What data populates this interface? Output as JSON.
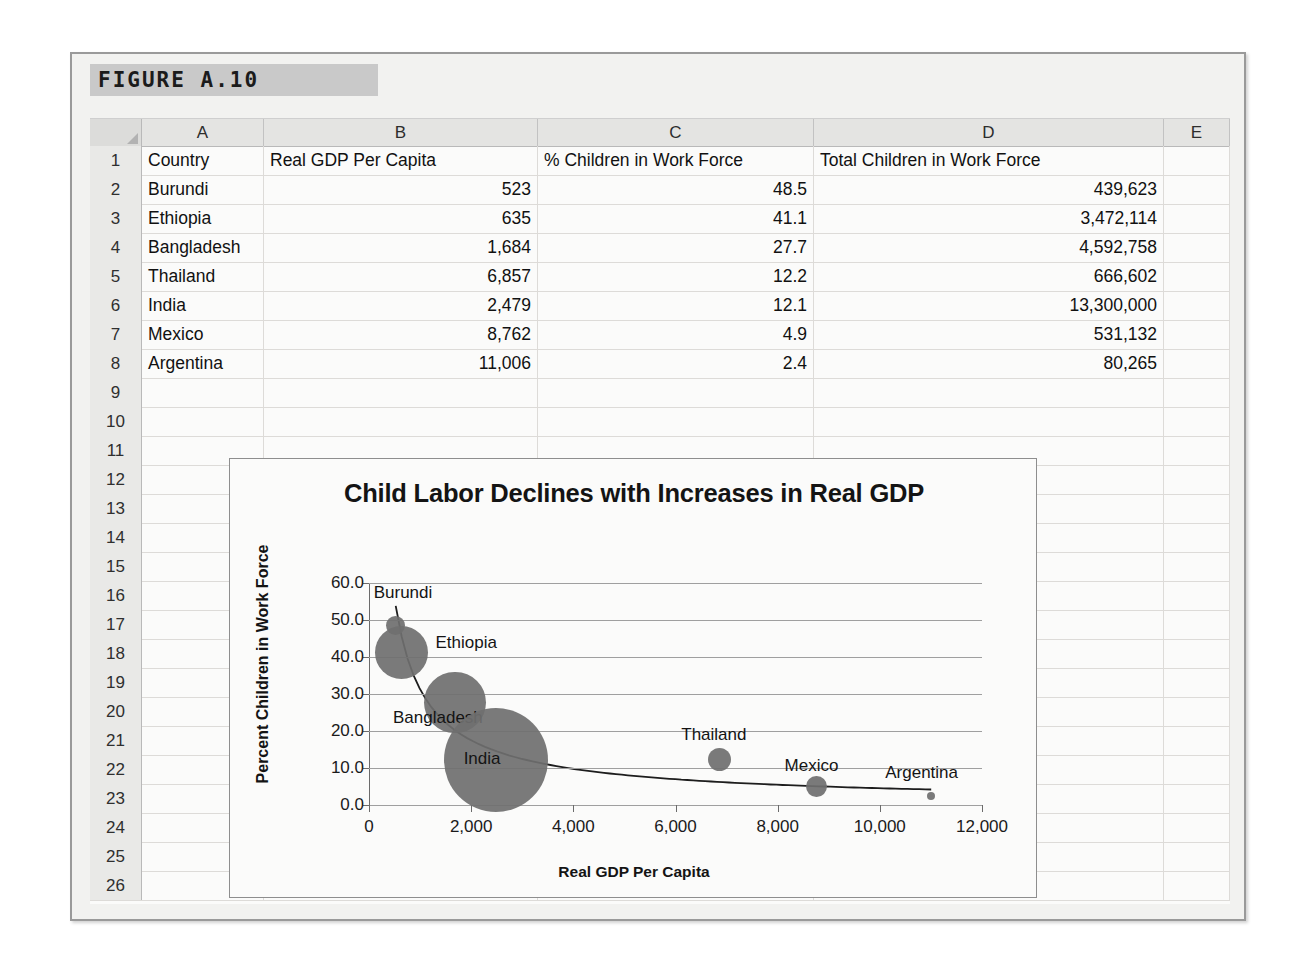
{
  "figure": {
    "banner_label": "FIGURE A.10"
  },
  "spreadsheet": {
    "column_headers": [
      "A",
      "B",
      "C",
      "D",
      "E"
    ],
    "row_numbers": [
      1,
      2,
      3,
      4,
      5,
      6,
      7,
      8,
      9,
      10,
      11,
      12,
      13,
      14,
      15,
      16,
      17,
      18,
      19,
      20,
      21,
      22,
      23,
      24,
      25,
      26
    ],
    "header_row": {
      "A": "Country",
      "B": "Real GDP Per Capita",
      "C": "% Children in Work Force",
      "D": "Total Children in Work Force",
      "E": ""
    },
    "rows": [
      {
        "row": 2,
        "A": "Burundi",
        "B": "523",
        "C": "48.5",
        "D": "439,623",
        "E": ""
      },
      {
        "row": 3,
        "A": "Ethiopia",
        "B": "635",
        "C": "41.1",
        "D": "3,472,114",
        "E": ""
      },
      {
        "row": 4,
        "A": "Bangladesh",
        "B": "1,684",
        "C": "27.7",
        "D": "4,592,758",
        "E": ""
      },
      {
        "row": 5,
        "A": "Thailand",
        "B": "6,857",
        "C": "12.2",
        "D": "666,602",
        "E": ""
      },
      {
        "row": 6,
        "A": "India",
        "B": "2,479",
        "C": "12.1",
        "D": "13,300,000",
        "E": ""
      },
      {
        "row": 7,
        "A": "Mexico",
        "B": "8,762",
        "C": "4.9",
        "D": "531,132",
        "E": ""
      },
      {
        "row": 8,
        "A": "Argentina",
        "B": "11,006",
        "C": "2.4",
        "D": "80,265",
        "E": ""
      }
    ]
  },
  "chart_data": {
    "type": "scatter",
    "title": "Child Labor Declines with Increases in Real GDP",
    "xlabel": "Real GDP Per Capita",
    "ylabel": "Percent Children in Work Force",
    "xlim": [
      0,
      12000
    ],
    "ylim": [
      0,
      60
    ],
    "xticks": [
      "0",
      "2,000",
      "4,000",
      "6,000",
      "8,000",
      "10,000",
      "12,000"
    ],
    "xtick_values": [
      0,
      2000,
      4000,
      6000,
      8000,
      10000,
      12000
    ],
    "yticks": [
      "0.0",
      "10.0",
      "20.0",
      "30.0",
      "40.0",
      "50.0",
      "60.0"
    ],
    "ytick_values": [
      0,
      10,
      20,
      30,
      40,
      50,
      60
    ],
    "grid": true,
    "legend": "none",
    "bubble_size_field": "Total Children in Work Force",
    "trendline": "power/decay fit through points",
    "bubble_color": "#6f6f6f",
    "points": [
      {
        "label": "Burundi",
        "x": 523,
        "y": 48.5,
        "size": 439623,
        "label_dx": -22,
        "label_dy": -34
      },
      {
        "label": "Ethiopia",
        "x": 635,
        "y": 41.1,
        "size": 3472114,
        "label_dx": 34,
        "label_dy": -11
      },
      {
        "label": "Bangladesh",
        "x": 1684,
        "y": 27.7,
        "size": 4592758,
        "label_dx": -62,
        "label_dy": 14
      },
      {
        "label": "India",
        "x": 2479,
        "y": 12.1,
        "size": 13300000,
        "label_dx": -32,
        "label_dy": -2
      },
      {
        "label": "Thailand",
        "x": 6857,
        "y": 12.2,
        "size": 666602,
        "label_dx": -38,
        "label_dy": -26
      },
      {
        "label": "Mexico",
        "x": 8762,
        "y": 4.9,
        "size": 531132,
        "label_dx": -32,
        "label_dy": -22
      },
      {
        "label": "Argentina",
        "x": 11006,
        "y": 2.4,
        "size": 80265,
        "label_dx": -46,
        "label_dy": -24
      }
    ]
  }
}
